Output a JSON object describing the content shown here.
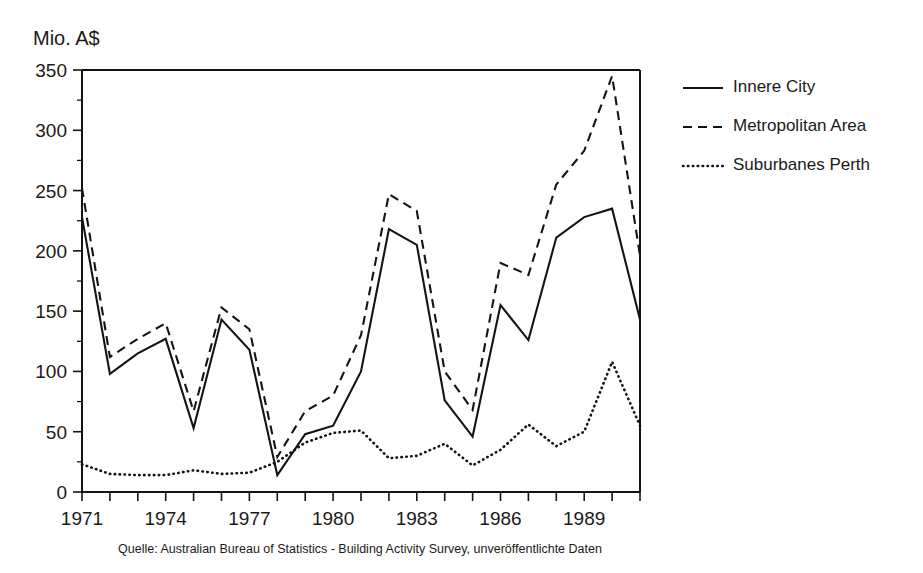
{
  "unit_label": "Mio. A$",
  "source_note": "Quelle: Australian Bureau of Statistics - Building Activity Survey, unveröffentlichte Daten",
  "legend": {
    "items": [
      {
        "label": "Innere City",
        "style": "solid"
      },
      {
        "label": "Metropolitan Area",
        "style": "dashed"
      },
      {
        "label": "Suburbanes Perth",
        "style": "dotted"
      }
    ]
  },
  "chart_data": {
    "type": "line",
    "title": "",
    "xlabel": "",
    "ylabel": "Mio. A$",
    "x": [
      1971,
      1972,
      1973,
      1974,
      1975,
      1976,
      1977,
      1978,
      1979,
      1980,
      1981,
      1982,
      1983,
      1984,
      1985,
      1986,
      1987,
      1988,
      1989,
      1990,
      1991
    ],
    "xlim": [
      1971,
      1991
    ],
    "ylim": [
      0,
      350
    ],
    "yticks": [
      0,
      50,
      100,
      150,
      200,
      250,
      300,
      350
    ],
    "yticks_minor": [
      25,
      75,
      125,
      175,
      225,
      275,
      325
    ],
    "xticks": [
      1971,
      1972,
      1973,
      1974,
      1975,
      1976,
      1977,
      1978,
      1979,
      1980,
      1981,
      1982,
      1983,
      1984,
      1985,
      1986,
      1987,
      1988,
      1989,
      1990,
      1991
    ],
    "xtick_labels": [
      "1971",
      "",
      "",
      "1974",
      "",
      "",
      "1977",
      "",
      "",
      "1980",
      "",
      "",
      "1983",
      "",
      "",
      "1986",
      "",
      "",
      "1989",
      "",
      ""
    ],
    "grid": false,
    "legend_position": "right",
    "series": [
      {
        "name": "Innere City",
        "style": "solid",
        "values": [
          228,
          98,
          115,
          127,
          53,
          143,
          118,
          14,
          48,
          55,
          100,
          218,
          205,
          76,
          46,
          155,
          126,
          211,
          228,
          235,
          143
        ]
      },
      {
        "name": "Metropolitan Area",
        "style": "dashed",
        "values": [
          252,
          112,
          127,
          140,
          67,
          153,
          135,
          29,
          67,
          80,
          130,
          247,
          233,
          100,
          68,
          190,
          180,
          255,
          283,
          345,
          196
        ]
      },
      {
        "name": "Suburbanes Perth",
        "style": "dotted",
        "values": [
          23,
          15,
          14,
          14,
          18,
          15,
          16,
          25,
          41,
          49,
          51,
          28,
          30,
          40,
          22,
          35,
          56,
          38,
          50,
          108,
          55
        ]
      }
    ]
  }
}
